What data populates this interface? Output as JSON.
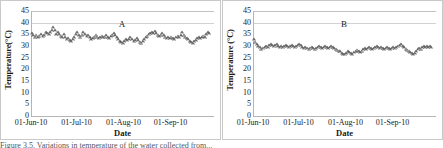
{
  "figure": {
    "caption_fragment": "Figure 3.5. Variations in temperature of the water collected from..."
  },
  "panels": [
    {
      "letter": "A",
      "ylabel": "Temperature(°C)",
      "xlabel": "Date",
      "yticks": [
        "0",
        "5",
        "10",
        "15",
        "20",
        "25",
        "30",
        "35",
        "40",
        "45"
      ],
      "xticks": [
        "01-Jun-10",
        "01-Jul-10",
        "01-Aug-10",
        "01-Sep-10"
      ]
    },
    {
      "letter": "B",
      "ylabel": "Temperature (°C)",
      "xlabel": "Date",
      "yticks": [
        "0",
        "5",
        "10",
        "15",
        "20",
        "25",
        "30",
        "35",
        "40",
        "45"
      ],
      "xticks": [
        "01-Jun-10",
        "01-Jul-10",
        "01-Aug-10",
        "01-Sep-10"
      ]
    }
  ],
  "chart_data": [
    {
      "type": "scatter",
      "title": "A",
      "xlabel": "Date",
      "ylabel": "Temperature(°C)",
      "ylim": [
        0,
        45
      ],
      "ytick_step": 5,
      "xlim": [
        "01-Jun-10",
        "30-Sep-10"
      ],
      "xtick_labels": [
        "01-Jun-10",
        "01-Jul-10",
        "01-Aug-10",
        "01-Sep-10"
      ],
      "xtick_days": [
        0,
        30,
        61,
        92
      ],
      "grid": "horizontal-top-only",
      "marker": "open-triangle",
      "legend": "none",
      "series": [
        {
          "name": "Water temperature",
          "x_days": [
            0,
            1,
            2,
            3,
            4,
            5,
            6,
            7,
            8,
            9,
            10,
            11,
            12,
            13,
            14,
            15,
            16,
            17,
            18,
            19,
            20,
            21,
            22,
            23,
            24,
            25,
            26,
            27,
            28,
            29,
            30,
            31,
            32,
            33,
            34,
            35,
            36,
            37,
            38,
            39,
            40,
            41,
            42,
            43,
            44,
            45,
            46,
            47,
            48,
            49,
            50,
            51,
            52,
            53,
            54,
            55,
            56,
            57,
            58,
            59,
            60,
            61,
            62,
            63,
            64,
            65,
            66,
            67,
            68,
            69,
            70,
            71,
            72,
            73,
            74,
            75,
            76,
            77,
            78,
            79,
            80,
            81,
            82,
            83,
            84,
            85,
            86,
            87,
            88,
            89,
            90,
            91,
            92,
            93,
            94,
            95,
            96,
            97,
            98,
            99,
            100,
            101,
            102,
            103,
            104,
            105,
            106,
            107,
            108,
            109,
            110,
            111,
            112,
            113,
            114,
            115,
            116,
            117
          ],
          "values": [
            34.0,
            33.2,
            32.6,
            33.4,
            32.2,
            33.0,
            33.6,
            32.8,
            33.2,
            34.6,
            34.0,
            33.8,
            34.4,
            35.4,
            36.8,
            35.2,
            33.6,
            34.4,
            33.8,
            33.0,
            32.4,
            33.6,
            32.4,
            31.6,
            32.0,
            31.2,
            30.8,
            31.6,
            32.4,
            33.8,
            34.6,
            33.2,
            32.6,
            33.4,
            34.6,
            33.6,
            32.8,
            33.2,
            32.2,
            31.6,
            32.0,
            32.6,
            33.4,
            32.6,
            32.0,
            32.4,
            33.0,
            32.2,
            32.6,
            33.2,
            32.4,
            32.0,
            32.8,
            33.4,
            34.2,
            33.2,
            32.4,
            31.6,
            30.8,
            30.2,
            29.8,
            30.6,
            31.4,
            31.0,
            31.6,
            32.2,
            31.4,
            30.8,
            31.2,
            31.8,
            31.0,
            30.4,
            30.0,
            30.6,
            31.4,
            32.2,
            33.0,
            33.6,
            34.2,
            34.6,
            34.0,
            34.8,
            34.2,
            33.4,
            32.8,
            33.4,
            34.0,
            33.2,
            32.6,
            32.0,
            32.4,
            32.0,
            32.6,
            32.0,
            31.6,
            32.2,
            33.0,
            32.4,
            33.2,
            34.6,
            33.4,
            32.6,
            32.0,
            31.4,
            30.8,
            30.2,
            29.8,
            30.6,
            31.2,
            31.8,
            32.4,
            31.8,
            32.4,
            33.0,
            32.4,
            33.8,
            34.6,
            34.2
          ]
        }
      ]
    },
    {
      "type": "scatter",
      "title": "B",
      "xlabel": "Date",
      "ylabel": "Temperature (°C)",
      "ylim": [
        0,
        45
      ],
      "ytick_step": 5,
      "xlim": [
        "01-Jun-10",
        "30-Sep-10"
      ],
      "xtick_labels": [
        "01-Jun-10",
        "01-Jul-10",
        "01-Aug-10",
        "01-Sep-10"
      ],
      "xtick_days": [
        0,
        30,
        61,
        92
      ],
      "grid": "horizontal-top-only",
      "marker": "open-triangle",
      "legend": "none",
      "series": [
        {
          "name": "Water temperature",
          "x_days": [
            0,
            1,
            2,
            3,
            4,
            5,
            6,
            7,
            8,
            9,
            10,
            11,
            12,
            13,
            14,
            15,
            16,
            17,
            18,
            19,
            20,
            21,
            22,
            23,
            24,
            25,
            26,
            27,
            28,
            29,
            30,
            31,
            32,
            33,
            34,
            35,
            36,
            37,
            38,
            39,
            40,
            41,
            42,
            43,
            44,
            45,
            46,
            47,
            48,
            49,
            50,
            51,
            52,
            53,
            54,
            55,
            56,
            57,
            58,
            59,
            60,
            61,
            62,
            63,
            64,
            65,
            66,
            67,
            68,
            69,
            70,
            71,
            72,
            73,
            74,
            75,
            76,
            77,
            78,
            79,
            80,
            81,
            82,
            83,
            84,
            85,
            86,
            87,
            88,
            89,
            90,
            91,
            92,
            93,
            94,
            95,
            96,
            97,
            98,
            99,
            100,
            101,
            102,
            103,
            104,
            105,
            106,
            107,
            108,
            109,
            110,
            111,
            112,
            113,
            114,
            115,
            116,
            117
          ],
          "values": [
            31.6,
            30.4,
            29.2,
            28.6,
            28.0,
            27.4,
            27.8,
            28.2,
            28.6,
            28.2,
            28.8,
            29.4,
            29.0,
            28.6,
            28.8,
            29.2,
            28.6,
            28.2,
            28.6,
            28.2,
            28.6,
            28.8,
            28.4,
            28.0,
            28.4,
            28.8,
            28.4,
            28.0,
            28.4,
            28.8,
            29.4,
            28.8,
            28.2,
            27.8,
            28.2,
            27.8,
            27.4,
            27.8,
            28.2,
            27.8,
            27.4,
            27.8,
            28.2,
            28.6,
            28.2,
            27.8,
            28.2,
            28.6,
            28.2,
            27.8,
            28.2,
            28.6,
            28.2,
            27.8,
            27.4,
            27.0,
            26.6,
            26.2,
            25.6,
            25.2,
            25.0,
            25.6,
            26.2,
            26.0,
            25.4,
            25.0,
            26.0,
            26.6,
            27.0,
            26.4,
            26.0,
            26.6,
            27.2,
            27.6,
            27.2,
            27.6,
            28.0,
            27.6,
            27.2,
            27.6,
            28.0,
            28.4,
            28.0,
            27.6,
            28.0,
            27.6,
            27.2,
            27.6,
            28.0,
            27.6,
            27.2,
            27.6,
            28.0,
            27.6,
            28.0,
            28.4,
            28.8,
            29.4,
            28.6,
            28.0,
            27.4,
            27.0,
            26.6,
            26.0,
            25.4,
            25.0,
            25.6,
            26.4,
            27.2,
            27.8,
            27.4,
            28.0,
            28.4,
            28.0,
            28.4,
            28.2,
            28.6,
            28.2
          ]
        }
      ]
    }
  ]
}
